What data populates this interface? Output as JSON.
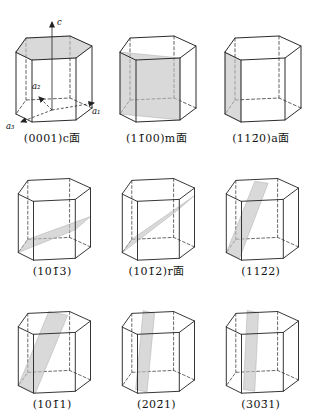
{
  "figure": {
    "description": "Hexagonal crystal system lattice planes (Miller-Bravais indices)",
    "axes": {
      "c": "c",
      "a1": "a₁",
      "a2": "a₂",
      "a3": "a₃"
    },
    "colors": {
      "line": "#2b2b2b",
      "plane_fill": "#c2c2c2",
      "background": "#ffffff"
    },
    "cells": [
      {
        "label": "(0001)c面",
        "plane": "basal-plane-top-face",
        "plane_points": "14,39 24,25 68,23 90,33 74,45 30,47"
      },
      {
        "label": "(11̄00)m面",
        "plane": "prism-plane-vertical-wide",
        "plane_points": "14,39 74,45 74,107 14,101"
      },
      {
        "label": "(112̄0)a面",
        "plane": "prism-plane-vertical-narrow",
        "plane_points": "14,39 30,47 30,109 14,101"
      },
      {
        "label": "(101̄3)",
        "plane": "pyramidal-plane-shallow",
        "plane_points": "14,101 24,87 90,63 74,77"
      },
      {
        "label": "(101̄2)r面",
        "plane": "pyramidal-plane-r",
        "plane_points": "14,101 24,87 90,41 74,55"
      },
      {
        "label": "(112̄2)",
        "plane": "pyramidal-plane-steep",
        "plane_points": "14,101 28,107 58,28 44,26"
      },
      {
        "label": "(101̄1)",
        "plane": "pyramidal-plane-wide-steep",
        "plane_points": "14,101 32,109 66,27 46,23"
      },
      {
        "label": "(202̄1)",
        "plane": "pyramidal-plane-near-vertical",
        "plane_points": "28,105 40,108 48,25 36,22"
      },
      {
        "label": "(303̄1)",
        "plane": "pyramidal-plane-most-vertical",
        "plane_points": "32,105 44,107 48,24 36,22"
      }
    ]
  }
}
